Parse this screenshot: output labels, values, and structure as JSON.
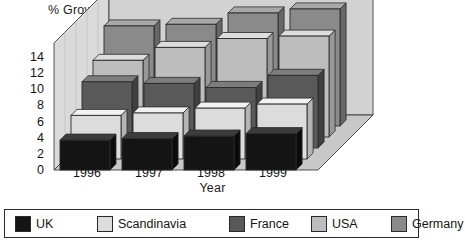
{
  "chart_data": {
    "type": "bar",
    "title": "",
    "ylabel": "% Growth rate",
    "xlabel": "Year",
    "categories": [
      "1996",
      "1997",
      "1998",
      "1999"
    ],
    "yticks": [
      14,
      12,
      10,
      8,
      6,
      4,
      2,
      0
    ],
    "ylim": [
      0,
      15
    ],
    "grid": false,
    "legend_position": "bottom",
    "projection": "3d-depth",
    "series": [
      {
        "name": "UK",
        "color": "#141414",
        "top_color": "#3c3c3c",
        "side_color": "#0b0b0b",
        "values": [
          3.7,
          3.9,
          4.2,
          4.5
        ]
      },
      {
        "name": "Scandinavia",
        "color": "#dcdcdc",
        "top_color": "#f2f2f2",
        "side_color": "#b4b4b4",
        "values": [
          5.4,
          5.7,
          6.3,
          6.8
        ]
      },
      {
        "name": "France",
        "color": "#595959",
        "top_color": "#7d7d7d",
        "side_color": "#3f3f3f",
        "values": [
          8.2,
          8.0,
          7.5,
          9.0
        ]
      },
      {
        "name": "USA",
        "color": "#bdbdbd",
        "top_color": "#dddddd",
        "side_color": "#989898",
        "values": [
          9.5,
          11.1,
          12.2,
          12.5
        ]
      },
      {
        "name": "Germany",
        "color": "#8a8a8a",
        "top_color": "#a8a8a8",
        "side_color": "#676767",
        "values": [
          12.4,
          12.6,
          14.0,
          14.5
        ]
      }
    ]
  },
  "legend": {
    "items": [
      {
        "label": "UK"
      },
      {
        "label": "Scandinavia"
      },
      {
        "label": "France"
      },
      {
        "label": "USA"
      },
      {
        "label": "Germany"
      }
    ]
  },
  "colors": {
    "wall": "#d2d2d2",
    "wall_light": "#dadada",
    "floor": "#c8c8c8",
    "outline": "#2b2b2b",
    "text": "#141414",
    "background": "#ffffff"
  }
}
